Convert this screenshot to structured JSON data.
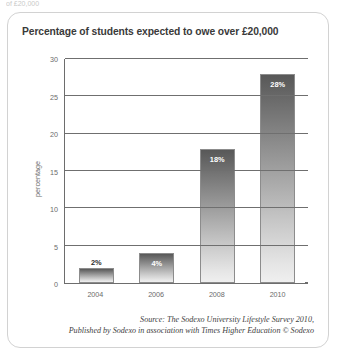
{
  "page": {
    "top_clipped_text": "of £20,000"
  },
  "panel": {
    "title": "Percentage of students expected to owe over £20,000"
  },
  "source": {
    "line1": "Source: The Sodexo University Lifestyle Survey 2010,",
    "line2": "Published by Sodexo in association with Times Higher Education © Sodexo"
  },
  "colors": {
    "panel_border": "#d2d2d2",
    "axis": "#6d6d6d",
    "bar_top": "#585858",
    "bar_bottom": "#efefef",
    "title_text": "#3a3a3a",
    "tick_text": "#6b6b6b"
  },
  "chart_data": {
    "type": "bar",
    "title": "Percentage of students expected to owe over £20,000",
    "xlabel": "",
    "ylabel": "percentage",
    "categories": [
      "2004",
      "2006",
      "2008",
      "2010"
    ],
    "values": [
      2,
      4,
      18,
      28
    ],
    "data_labels": [
      "2%",
      "4%",
      "18%",
      "28%"
    ],
    "label_placement": [
      "outside",
      "inside",
      "inside",
      "inside"
    ],
    "ylim": [
      0,
      30
    ],
    "yticks": [
      0,
      5,
      10,
      15,
      20,
      25,
      30
    ],
    "ytick_labels": [
      "0",
      "5",
      "10",
      "15",
      "20",
      "25",
      "30"
    ],
    "grid": "horizontal",
    "legend": "none"
  }
}
